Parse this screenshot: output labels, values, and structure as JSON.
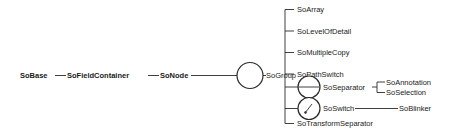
{
  "diagram": {
    "type": "class-hierarchy",
    "chain": [
      {
        "id": "sobase",
        "label": "SoBase",
        "bold": true
      },
      {
        "id": "sofieldcontainer",
        "label": "SoFieldContainer",
        "bold": true
      },
      {
        "id": "sonode",
        "label": "SoNode",
        "bold": true
      },
      {
        "id": "sogroup",
        "label": "SoGroup",
        "bold": false,
        "symbol": "circle"
      }
    ],
    "group_children": [
      {
        "id": "soarray",
        "label": "SoArray"
      },
      {
        "id": "solevelofdetail",
        "label": "SoLevelOfDetail"
      },
      {
        "id": "somultiplecopy",
        "label": "SoMultipleCopy"
      },
      {
        "id": "sopathswitch",
        "label": "SoPathSwitch"
      },
      {
        "id": "soseparator",
        "label": "SoSeparator",
        "symbol": "separator-circle"
      },
      {
        "id": "soswitch",
        "label": "SoSwitch",
        "symbol": "switch-circle"
      },
      {
        "id": "sotransformseparator",
        "label": "SoTransformSeparator"
      }
    ],
    "separator_children": [
      {
        "id": "soannotation",
        "label": "SoAnnotation"
      },
      {
        "id": "soselection",
        "label": "SoSelection"
      }
    ],
    "switch_children": [
      {
        "id": "soblinker",
        "label": "SoBlinker"
      }
    ]
  }
}
